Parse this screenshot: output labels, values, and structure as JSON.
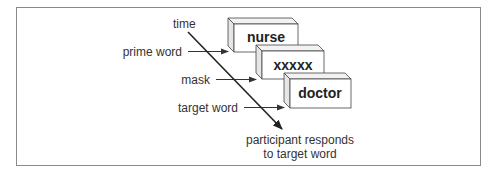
{
  "diagram": {
    "type": "masked priming procedure",
    "labels": {
      "time": "time",
      "prime": "prime word",
      "mask": "mask",
      "target": "target word",
      "response_line1": "participant responds",
      "response_line2": "to target word"
    },
    "screens": [
      {
        "name": "prime",
        "word": "nurse"
      },
      {
        "name": "mask",
        "word": "xxxxx"
      },
      {
        "name": "target",
        "word": "doctor"
      }
    ],
    "colors": {
      "frame": "#8a8a8a",
      "box_front": "#ffffff",
      "box_side": "#e6e6e6",
      "box_top": "#f2f2f2",
      "stroke": "#333333"
    }
  }
}
